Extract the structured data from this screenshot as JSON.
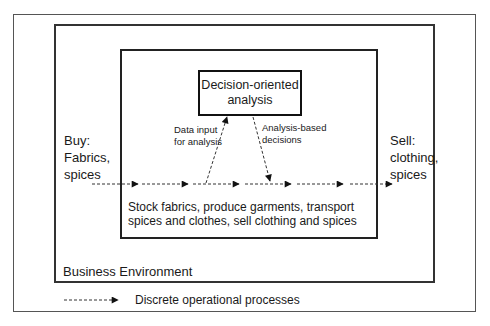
{
  "diagram": {
    "decision_box": "Decision-oriented\nanalysis",
    "buy_label": "Buy:\nFabrics,\nspices",
    "sell_label": "Sell:\nclothing,\nspices",
    "data_input_label": "Data input\nfor analysis",
    "analysis_decisions_label": "Analysis-based\ndecisions",
    "operations_text": "Stock fabrics, produce garments, transport\nspices and clothes, sell clothing and spices",
    "environment_label": "Business Environment",
    "legend_label": "Discrete operational processes"
  }
}
